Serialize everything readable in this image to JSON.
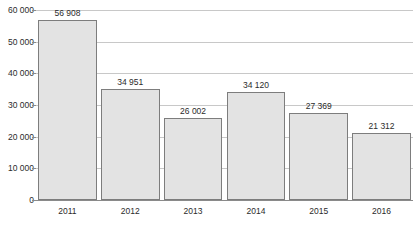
{
  "chart_data": {
    "type": "bar",
    "title": "",
    "xlabel": "",
    "ylabel": "",
    "categories": [
      "2011",
      "2012",
      "2013",
      "2014",
      "2015",
      "2016"
    ],
    "values": [
      56908,
      34951,
      26002,
      34120,
      27369,
      21312
    ],
    "value_labels": [
      "56 908",
      "34 951",
      "26 002",
      "34 120",
      "27 369",
      "21 312"
    ],
    "ylim": [
      0,
      60000
    ],
    "ytick_values": [
      0,
      10000,
      20000,
      30000,
      40000,
      50000,
      60000
    ],
    "ytick_labels": [
      "0",
      "10 000",
      "20 000",
      "30 000",
      "40 000",
      "50 000",
      "60 000"
    ],
    "grid": true,
    "legend": false,
    "legend_position": "none",
    "colors": {
      "bar_fill": "#e3e3e3",
      "bar_border": "#7d7d7d",
      "gridline": "#c8c8c8",
      "axis": "#8a8a8a",
      "text": "#2b2b2b",
      "background": "#ffffff"
    }
  }
}
